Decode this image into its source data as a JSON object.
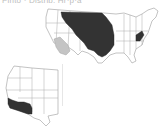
{
  "caption": "Pinto · Distrib. Hr·p·a",
  "colors": {
    "range_primary": "#333333",
    "range_secondary": "#c4c4c4",
    "state_outline": "#9a9a9a",
    "background": "#ffffff"
  },
  "maps": [
    {
      "name": "conterminous-us",
      "highlighted_regions": [
        "Great Plains (primary range)",
        "Virginia/West Virginia (primary range)",
        "Arizona/New Mexico (secondary range)"
      ]
    },
    {
      "name": "western-us",
      "highlighted_regions": [
        "Southern California / Arizona (primary range)"
      ]
    }
  ]
}
